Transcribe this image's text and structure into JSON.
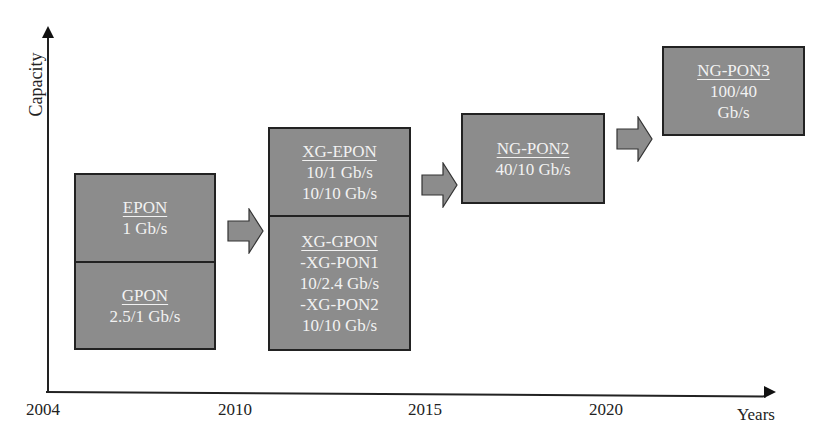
{
  "axes": {
    "y_label": "Capacity",
    "x_label": "Years",
    "x_ticks": [
      {
        "label": "2004",
        "x": 26
      },
      {
        "label": "2010",
        "x": 218
      },
      {
        "label": "2015",
        "x": 408
      },
      {
        "label": "2020",
        "x": 589
      }
    ]
  },
  "generations": [
    {
      "title": "EPON",
      "lines": [
        "1 Gb/s"
      ]
    },
    {
      "title": "GPON",
      "lines": [
        "2.5/1 Gb/s"
      ]
    },
    {
      "title": "XG-EPON",
      "lines": [
        "10/1 Gb/s",
        "10/10 Gb/s"
      ]
    },
    {
      "title": "XG-GPON",
      "lines": [
        "-XG-PON1",
        "10/2.4 Gb/s",
        "-XG-PON2",
        "10/10 Gb/s"
      ]
    },
    {
      "title": "NG-PON2",
      "lines": [
        "40/10 Gb/s"
      ]
    },
    {
      "title": "NG-PON3",
      "lines": [
        "100/40",
        "Gb/s"
      ]
    }
  ],
  "colors": {
    "box_fill": "#8c8c8c",
    "box_border": "#222222",
    "box_text": "#f2f2f2",
    "arrow_fill": "#8c8c8c"
  }
}
